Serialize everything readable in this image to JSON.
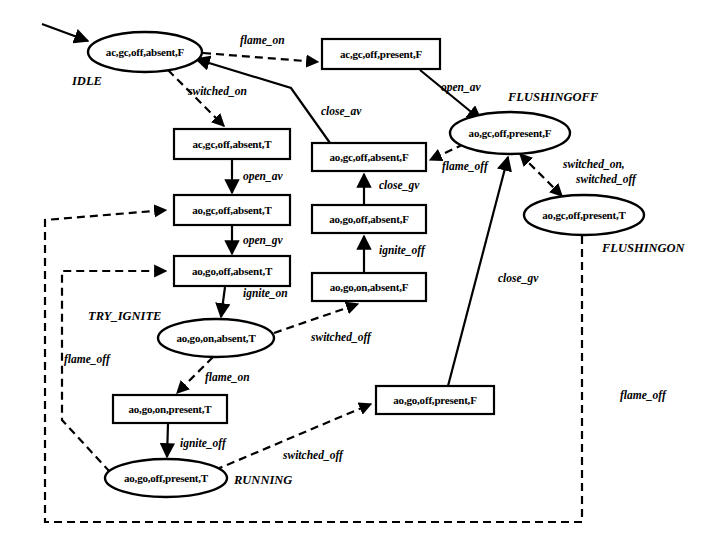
{
  "diagram": {
    "type": "state-machine",
    "width": 717,
    "height": 558,
    "background": "#ffffff",
    "stroke_color": "#000000"
  },
  "nodes": [
    {
      "id": "idle",
      "shape": "ellipse",
      "label": "ac,gc,off,absent,F",
      "state_name": "IDLE",
      "cx": 145,
      "cy": 52,
      "rx": 57,
      "ry": 20,
      "name_x": 72,
      "name_y": 85
    },
    {
      "id": "ac_present_f",
      "shape": "box",
      "label": "ac,gc,off,present,F",
      "state_name": "",
      "cx": 381,
      "cy": 54,
      "w": 118,
      "h": 30
    },
    {
      "id": "flushingoff",
      "shape": "ellipse",
      "label": "ao,gc,off,present,F",
      "state_name": "FLUSHINGOFF",
      "cx": 510,
      "cy": 133,
      "rx": 60,
      "ry": 21,
      "name_x": 508,
      "name_y": 101
    },
    {
      "id": "flushingon",
      "shape": "ellipse",
      "label": "ao,gc,off,present,T",
      "state_name": "FLUSHINGON",
      "cx": 584,
      "cy": 215,
      "rx": 60,
      "ry": 20,
      "name_x": 602,
      "name_y": 252
    },
    {
      "id": "ac_absent_t",
      "shape": "box",
      "label": "ac,gc,off,absent,T",
      "state_name": "",
      "cx": 232,
      "cy": 144,
      "w": 116,
      "h": 30
    },
    {
      "id": "ao_gc_absent_t",
      "shape": "box",
      "label": "ao,gc,off,absent,T",
      "state_name": "",
      "cx": 232,
      "cy": 210,
      "w": 116,
      "h": 30
    },
    {
      "id": "ao_go_absent_t",
      "shape": "box",
      "label": "ao,go,off,absent,T",
      "state_name": "",
      "cx": 232,
      "cy": 271,
      "w": 116,
      "h": 30
    },
    {
      "id": "try_ignite",
      "shape": "ellipse",
      "label": "ao,go,on,absent,T",
      "state_name": "TRY_IGNITE",
      "cx": 216,
      "cy": 338,
      "rx": 58,
      "ry": 19,
      "name_x": 88,
      "name_y": 315
    },
    {
      "id": "ao_go_on_pres",
      "shape": "box",
      "label": "ao,go,on,present,T",
      "state_name": "",
      "cx": 170,
      "cy": 409,
      "w": 114,
      "h": 28
    },
    {
      "id": "running",
      "shape": "ellipse",
      "label": "ao,go,off,present,T",
      "state_name": "RUNNING",
      "cx": 166,
      "cy": 478,
      "rx": 61,
      "ry": 19,
      "name_x": 234,
      "name_y": 483
    },
    {
      "id": "ao_gc_absent_f",
      "shape": "box",
      "label": "ao,gc,off,absent,F",
      "state_name": "",
      "cx": 369,
      "cy": 157,
      "w": 114,
      "h": 28
    },
    {
      "id": "ao_go_absent_f",
      "shape": "box",
      "label": "ao,go,off,absent,F",
      "state_name": "",
      "cx": 369,
      "cy": 219,
      "w": 114,
      "h": 28
    },
    {
      "id": "ao_go_on_abs_f",
      "shape": "box",
      "label": "ao,go,on,absent,F",
      "state_name": "",
      "cx": 369,
      "cy": 287,
      "w": 114,
      "h": 28
    },
    {
      "id": "ao_go_off_pres_f",
      "shape": "box",
      "label": "ao,go,off,present,F",
      "state_name": "",
      "cx": 435,
      "cy": 400,
      "w": 118,
      "h": 28
    }
  ],
  "edges": [
    {
      "id": "e-init",
      "from": "",
      "to": "idle",
      "label": "",
      "style": "solid",
      "label_x": 0,
      "label_y": 0
    },
    {
      "id": "e-flame-on-1",
      "from": "idle",
      "to": "ac_present_f",
      "label": "flame_on",
      "style": "dashed",
      "label_x": 240,
      "label_y": 44
    },
    {
      "id": "e-switched-on-1",
      "from": "idle",
      "to": "ac_absent_t",
      "label": "switched_on",
      "style": "dashed",
      "label_x": 188,
      "label_y": 95
    },
    {
      "id": "e-open-av-1",
      "from": "ac_present_f",
      "to": "flushingoff",
      "label": "open_av",
      "style": "solid",
      "label_x": 441,
      "label_y": 91
    },
    {
      "id": "e-close-av",
      "from": "ao_gc_absent_f",
      "to": "idle",
      "label": "close_av",
      "style": "solid",
      "label_x": 321,
      "label_y": 115
    },
    {
      "id": "e-open-av-2",
      "from": "ac_absent_t",
      "to": "ao_gc_absent_t",
      "label": "open_av",
      "style": "solid",
      "label_x": 243,
      "label_y": 180
    },
    {
      "id": "e-open-gv",
      "from": "ao_gc_absent_t",
      "to": "ao_go_absent_t",
      "label": "open_gv",
      "style": "solid",
      "label_x": 243,
      "label_y": 244
    },
    {
      "id": "e-ignite-on",
      "from": "ao_go_absent_t",
      "to": "try_ignite",
      "label": "ignite_on",
      "style": "solid",
      "label_x": 243,
      "label_y": 297
    },
    {
      "id": "e-flame-on-2",
      "from": "try_ignite",
      "to": "ao_go_on_pres",
      "label": "flame_on",
      "style": "dashed",
      "label_x": 205,
      "label_y": 381
    },
    {
      "id": "e-ignite-off-1",
      "from": "ao_go_on_pres",
      "to": "running",
      "label": "ignite_off",
      "style": "solid",
      "label_x": 180,
      "label_y": 447
    },
    {
      "id": "e-switched-off-1",
      "from": "try_ignite",
      "to": "ao_go_on_abs_f",
      "label": "switched_off",
      "style": "dashed",
      "label_x": 311,
      "label_y": 341
    },
    {
      "id": "e-ignite-off-2",
      "from": "ao_go_on_abs_f",
      "to": "ao_go_absent_f",
      "label": "ignite_off",
      "style": "solid",
      "label_x": 379,
      "label_y": 254
    },
    {
      "id": "e-close-gv-1",
      "from": "ao_go_absent_f",
      "to": "ao_gc_absent_f",
      "label": "close_gv",
      "style": "solid",
      "label_x": 379,
      "label_y": 189
    },
    {
      "id": "e-flame-off-1",
      "from": "flushingoff",
      "to": "ao_gc_absent_f",
      "label": "flame_off",
      "style": "dashed",
      "label_x": 442,
      "label_y": 170
    },
    {
      "id": "e-switched",
      "from": "flushingoff",
      "to": "flushingon",
      "label": "switched_on,",
      "label2": "switched_off",
      "style": "dashed",
      "label_x": 563,
      "label_y": 168,
      "label2_x": 576,
      "label2_y": 183
    },
    {
      "id": "e-switched-off-2",
      "from": "running",
      "to": "ao_go_off_pres_f",
      "label": "switched_off",
      "style": "dashed",
      "label_x": 283,
      "label_y": 459
    },
    {
      "id": "e-close-gv-2",
      "from": "ao_go_off_pres_f",
      "to": "flushingoff",
      "label": "close_gv",
      "style": "solid",
      "label_x": 498,
      "label_y": 282
    },
    {
      "id": "e-flame-off-2",
      "from": "running",
      "to": "ao_go_absent_t",
      "label": "flame_off",
      "style": "dashed",
      "label_x": 64,
      "label_y": 363
    },
    {
      "id": "e-flame-off-3",
      "from": "flushingon",
      "to": "ao_gc_absent_t",
      "label": "flame_off",
      "style": "dashed",
      "label_x": 620,
      "label_y": 399
    }
  ],
  "legend": {
    "solid_meaning": "controller action transition",
    "dashed_meaning": "environment event transition"
  }
}
